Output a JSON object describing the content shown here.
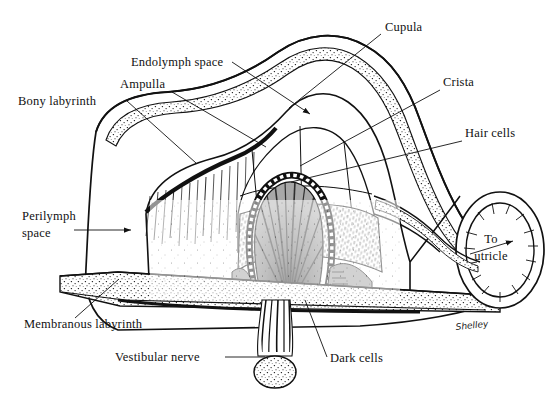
{
  "figure": {
    "kind": "anatomical-illustration",
    "background_color": "#ffffff",
    "ink_color": "#111111",
    "signature": "Shelley"
  },
  "labels": [
    {
      "id": "bony-labyrinth",
      "text": "Bony labyrinth",
      "lines": [
        "Bony labyrinth"
      ],
      "x": 18,
      "y": 105,
      "anchor": "start"
    },
    {
      "id": "endolymph-space",
      "text": "Endolymph space",
      "lines": [
        "Endolymph space"
      ],
      "x": 131,
      "y": 66,
      "anchor": "start"
    },
    {
      "id": "ampulla",
      "text": "Ampulla",
      "lines": [
        "Ampulla"
      ],
      "x": 120,
      "y": 88,
      "anchor": "start"
    },
    {
      "id": "cupula",
      "text": "Cupula",
      "lines": [
        "Cupula"
      ],
      "x": 385,
      "y": 31,
      "anchor": "start"
    },
    {
      "id": "crista",
      "text": "Crista",
      "lines": [
        "Crista"
      ],
      "x": 443,
      "y": 86,
      "anchor": "start"
    },
    {
      "id": "hair-cells",
      "text": "Hair cells",
      "lines": [
        "Hair cells"
      ],
      "x": 465,
      "y": 137,
      "anchor": "start"
    },
    {
      "id": "to-utricle",
      "text": "To utricle",
      "lines": [
        "To",
        "utricle"
      ],
      "x": 491,
      "y": 243,
      "anchor": "middle"
    },
    {
      "id": "perilymph-space",
      "text": "Perilymph space",
      "lines": [
        "Perilymph",
        "space"
      ],
      "x": 22,
      "y": 220,
      "anchor": "start"
    },
    {
      "id": "membranous-labyrinth",
      "text": "Membranous labyrinth",
      "lines": [
        "Membranous labyrinth"
      ],
      "x": 24,
      "y": 328,
      "anchor": "start"
    },
    {
      "id": "vestibular-nerve",
      "text": "Vestibular nerve",
      "lines": [
        "Vestibular nerve"
      ],
      "x": 115,
      "y": 361,
      "anchor": "start"
    },
    {
      "id": "dark-cells",
      "text": "Dark cells",
      "lines": [
        "Dark cells"
      ],
      "x": 330,
      "y": 362,
      "anchor": "start"
    }
  ],
  "leaders": [
    {
      "id": "leader-bony-labyrinth",
      "d": "M127,101 L196,163"
    },
    {
      "id": "leader-endolymph-space",
      "d": "M232,62 L310,114"
    },
    {
      "id": "leader-ampulla",
      "d": "M172,92 L266,147"
    },
    {
      "id": "leader-cupula",
      "d": "M381,34 L289,108"
    },
    {
      "id": "leader-crista",
      "d": "M440,90 L300,166"
    },
    {
      "id": "leader-hair-cells",
      "d": "M462,141 L291,182"
    },
    {
      "id": "leader-to-utricle",
      "d": "M470,254 L513,241"
    },
    {
      "id": "leader-perilymph-space",
      "d": "M74,230 L131,230"
    },
    {
      "id": "leader-membranous-labyrinth",
      "d": "M75,318 L119,279"
    },
    {
      "id": "leader-vestibular-nerve",
      "d": "M225,357 L265,357"
    },
    {
      "id": "leader-dark-cells",
      "d": "M327,357 L305,300"
    }
  ],
  "arrows": [
    {
      "id": "arrow-endolymph-space",
      "x": 310,
      "y": 114
    },
    {
      "id": "arrow-perilymph-space",
      "x": 131,
      "y": 230
    },
    {
      "id": "arrow-to-utricle",
      "x": 470,
      "y": 254
    }
  ],
  "structures": [
    {
      "id": "bony-labyrinth-wall",
      "description": "outer stippled bone capsule enclosing the whole ampulla"
    },
    {
      "id": "perilymph-space",
      "description": "clear space between bony wall and membranous duct"
    },
    {
      "id": "membranous-labyrinth",
      "description": "thin membranous duct lining, stippled band along the floor"
    },
    {
      "id": "endolymph-space",
      "description": "open lumen of the ampulla above the crista"
    },
    {
      "id": "ampulla-dome",
      "description": "expanded dome of the semicircular duct"
    },
    {
      "id": "cupula",
      "description": "gelatinous gray dome rising from the crista into the lumen"
    },
    {
      "id": "crista-ampullaris",
      "description": "dark ridge of sensory epithelium with radiating fibers"
    },
    {
      "id": "hair-cells",
      "description": "hair cell layer with stereocilia projecting into the cupula"
    },
    {
      "id": "dark-cells",
      "description": "gray shaded epithelium flanking the base of the crista"
    },
    {
      "id": "vestibular-nerve",
      "description": "nerve bundle descending from the crista base"
    },
    {
      "id": "utricle-opening",
      "description": "tubular canal opening at right leading to the utricle"
    }
  ]
}
